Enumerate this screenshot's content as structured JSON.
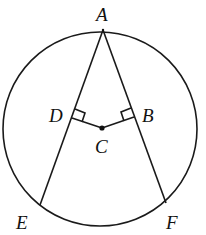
{
  "diagram": {
    "type": "circle-geometry",
    "circle": {
      "cx": 100,
      "cy": 129,
      "r": 97
    },
    "points": {
      "A": {
        "label": "A",
        "x": 103,
        "y": 30,
        "lx": 96,
        "ly": 21
      },
      "B": {
        "label": "B",
        "x": 134,
        "y": 117,
        "lx": 142,
        "ly": 122
      },
      "C": {
        "label": "C",
        "x": 102,
        "y": 128,
        "lx": 95,
        "ly": 153
      },
      "D": {
        "label": "D",
        "x": 72,
        "y": 118,
        "lx": 49,
        "ly": 122
      },
      "E": {
        "label": "E",
        "x": 40,
        "y": 205,
        "lx": 16,
        "ly": 229
      },
      "F": {
        "label": "F",
        "x": 166,
        "y": 203,
        "lx": 166,
        "ly": 229
      }
    },
    "segments": [
      [
        "A",
        "E"
      ],
      [
        "A",
        "F"
      ],
      [
        "C",
        "D"
      ],
      [
        "C",
        "B"
      ]
    ],
    "right_angles": [
      "D",
      "B"
    ]
  }
}
